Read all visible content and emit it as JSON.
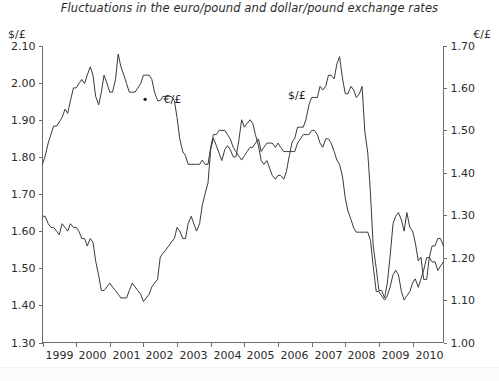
{
  "figure": {
    "title": "Fluctuations in the euro/pound and dollar/pound exchange rates",
    "left_axis_label": "$/£",
    "right_axis_label": "€/£"
  },
  "chart_data": {
    "type": "line",
    "title": "Fluctuations in the euro/pound and dollar/pound exchange rates",
    "xlabel": "",
    "ylabel": "$/£",
    "ylabel_right": "€/£",
    "grid": false,
    "legend": "inline-labels",
    "xlim": [
      1999.0,
      2010.92
    ],
    "ylim": [
      1.3,
      2.1
    ],
    "ylim_right": [
      1.0,
      1.7
    ],
    "yticks": [
      1.3,
      1.4,
      1.5,
      1.6,
      1.7,
      1.8,
      1.9,
      2.0,
      2.1
    ],
    "yticks_right": [
      1.0,
      1.1,
      1.2,
      1.3,
      1.4,
      1.5,
      1.6,
      1.7
    ],
    "xticks": [
      1999,
      2000,
      2001,
      2002,
      2003,
      2004,
      2005,
      2006,
      2007,
      2008,
      2009,
      2010
    ],
    "xtick_labels": [
      "1999",
      "2000",
      "2001",
      "2002",
      "2003",
      "2004",
      "2005",
      "2006",
      "2007",
      "2008",
      "2009",
      "2010"
    ],
    "annotations": [
      {
        "text": "€/£",
        "x": 2002.6,
        "y": 1.945,
        "axis": "left"
      },
      {
        "text": "$/£",
        "x": 2006.3,
        "y": 1.955,
        "axis": "left"
      }
    ],
    "series": [
      {
        "name": "€/£",
        "axis": "right",
        "unit": "euro per pound",
        "note": "plotted on right-hand scale 1.00-1.70",
        "x": [
          1999.0,
          1999.08,
          1999.17,
          1999.25,
          1999.33,
          1999.42,
          1999.5,
          1999.58,
          1999.67,
          1999.75,
          1999.83,
          1999.92,
          2000.0,
          2000.08,
          2000.17,
          2000.25,
          2000.33,
          2000.42,
          2000.5,
          2000.58,
          2000.67,
          2000.75,
          2000.83,
          2000.92,
          2001.0,
          2001.08,
          2001.17,
          2001.25,
          2001.33,
          2001.42,
          2001.5,
          2001.58,
          2001.67,
          2001.75,
          2001.83,
          2001.92,
          2002.0,
          2002.08,
          2002.17,
          2002.25,
          2002.33,
          2002.42,
          2002.5,
          2002.58,
          2002.67,
          2002.75,
          2002.83,
          2002.92,
          2003.0,
          2003.08,
          2003.17,
          2003.25,
          2003.33,
          2003.42,
          2003.5,
          2003.58,
          2003.67,
          2003.75,
          2003.83,
          2003.92,
          2004.0,
          2004.08,
          2004.17,
          2004.25,
          2004.33,
          2004.42,
          2004.5,
          2004.58,
          2004.67,
          2004.75,
          2004.83,
          2004.92,
          2005.0,
          2005.08,
          2005.17,
          2005.25,
          2005.33,
          2005.42,
          2005.5,
          2005.58,
          2005.67,
          2005.75,
          2005.83,
          2005.92,
          2006.0,
          2006.08,
          2006.17,
          2006.25,
          2006.33,
          2006.42,
          2006.5,
          2006.58,
          2006.67,
          2006.75,
          2006.83,
          2006.92,
          2007.0,
          2007.08,
          2007.17,
          2007.25,
          2007.33,
          2007.42,
          2007.5,
          2007.58,
          2007.67,
          2007.75,
          2007.83,
          2007.92,
          2008.0,
          2008.08,
          2008.17,
          2008.25,
          2008.33,
          2008.42,
          2008.5,
          2008.58,
          2008.67,
          2008.75,
          2008.83,
          2008.92,
          2009.0,
          2009.08,
          2009.17,
          2009.25,
          2009.33,
          2009.42,
          2009.5,
          2009.58,
          2009.67,
          2009.75,
          2009.83,
          2009.92,
          2010.0,
          2010.08,
          2010.17,
          2010.25,
          2010.33,
          2010.42,
          2010.5,
          2010.58,
          2010.67,
          2010.75,
          2010.83,
          2010.92
        ],
        "values": [
          1.42,
          1.44,
          1.47,
          1.49,
          1.51,
          1.51,
          1.52,
          1.53,
          1.55,
          1.54,
          1.57,
          1.6,
          1.6,
          1.61,
          1.62,
          1.61,
          1.63,
          1.65,
          1.63,
          1.58,
          1.56,
          1.59,
          1.63,
          1.61,
          1.59,
          1.59,
          1.62,
          1.68,
          1.65,
          1.63,
          1.61,
          1.59,
          1.59,
          1.59,
          1.6,
          1.61,
          1.63,
          1.63,
          1.63,
          1.62,
          1.59,
          1.57,
          1.57,
          1.58,
          1.58,
          1.58,
          1.58,
          1.57,
          1.53,
          1.48,
          1.45,
          1.44,
          1.42,
          1.42,
          1.42,
          1.42,
          1.42,
          1.43,
          1.42,
          1.42,
          1.46,
          1.49,
          1.49,
          1.5,
          1.5,
          1.5,
          1.49,
          1.48,
          1.46,
          1.45,
          1.44,
          1.43,
          1.44,
          1.45,
          1.46,
          1.46,
          1.47,
          1.48,
          1.45,
          1.46,
          1.47,
          1.47,
          1.47,
          1.46,
          1.47,
          1.46,
          1.45,
          1.45,
          1.45,
          1.45,
          1.45,
          1.47,
          1.48,
          1.49,
          1.49,
          1.49,
          1.5,
          1.5,
          1.49,
          1.47,
          1.46,
          1.48,
          1.48,
          1.47,
          1.45,
          1.43,
          1.42,
          1.39,
          1.34,
          1.31,
          1.29,
          1.27,
          1.26,
          1.26,
          1.26,
          1.26,
          1.26,
          1.24,
          1.18,
          1.12,
          1.12,
          1.11,
          1.1,
          1.11,
          1.13,
          1.16,
          1.17,
          1.16,
          1.12,
          1.1,
          1.11,
          1.12,
          1.14,
          1.15,
          1.13,
          1.15,
          1.17,
          1.2,
          1.2,
          1.19,
          1.19,
          1.17,
          1.18,
          1.19
        ]
      },
      {
        "name": "$/£",
        "axis": "left",
        "unit": "dollars per pound",
        "note": "plotted on left-hand scale 1.30-2.10",
        "x": [
          1999.0,
          1999.08,
          1999.17,
          1999.25,
          1999.33,
          1999.42,
          1999.5,
          1999.58,
          1999.67,
          1999.75,
          1999.83,
          1999.92,
          2000.0,
          2000.08,
          2000.17,
          2000.25,
          2000.33,
          2000.42,
          2000.5,
          2000.58,
          2000.67,
          2000.75,
          2000.83,
          2000.92,
          2001.0,
          2001.08,
          2001.17,
          2001.25,
          2001.33,
          2001.42,
          2001.5,
          2001.58,
          2001.67,
          2001.75,
          2001.83,
          2001.92,
          2002.0,
          2002.08,
          2002.17,
          2002.25,
          2002.33,
          2002.42,
          2002.5,
          2002.58,
          2002.67,
          2002.75,
          2002.83,
          2002.92,
          2003.0,
          2003.08,
          2003.17,
          2003.25,
          2003.33,
          2003.42,
          2003.5,
          2003.58,
          2003.67,
          2003.75,
          2003.83,
          2003.92,
          2004.0,
          2004.08,
          2004.17,
          2004.25,
          2004.33,
          2004.42,
          2004.5,
          2004.58,
          2004.67,
          2004.75,
          2004.83,
          2004.92,
          2005.0,
          2005.08,
          2005.17,
          2005.25,
          2005.33,
          2005.42,
          2005.5,
          2005.58,
          2005.67,
          2005.75,
          2005.83,
          2005.92,
          2006.0,
          2006.08,
          2006.17,
          2006.25,
          2006.33,
          2006.42,
          2006.5,
          2006.58,
          2006.67,
          2006.75,
          2006.83,
          2006.92,
          2007.0,
          2007.08,
          2007.17,
          2007.25,
          2007.33,
          2007.42,
          2007.5,
          2007.58,
          2007.67,
          2007.75,
          2007.83,
          2007.92,
          2008.0,
          2008.08,
          2008.17,
          2008.25,
          2008.33,
          2008.42,
          2008.5,
          2008.58,
          2008.67,
          2008.75,
          2008.83,
          2008.92,
          2009.0,
          2009.08,
          2009.17,
          2009.25,
          2009.33,
          2009.42,
          2009.5,
          2009.58,
          2009.67,
          2009.75,
          2009.83,
          2009.92,
          2010.0,
          2010.08,
          2010.17,
          2010.25,
          2010.33,
          2010.42,
          2010.5,
          2010.58,
          2010.67,
          2010.75,
          2010.83,
          2010.92
        ],
        "values": [
          1.64,
          1.64,
          1.62,
          1.61,
          1.61,
          1.6,
          1.59,
          1.62,
          1.61,
          1.6,
          1.62,
          1.61,
          1.61,
          1.6,
          1.58,
          1.58,
          1.56,
          1.58,
          1.57,
          1.52,
          1.48,
          1.44,
          1.44,
          1.45,
          1.46,
          1.45,
          1.44,
          1.43,
          1.42,
          1.42,
          1.42,
          1.44,
          1.46,
          1.45,
          1.44,
          1.43,
          1.41,
          1.42,
          1.43,
          1.45,
          1.46,
          1.47,
          1.53,
          1.54,
          1.55,
          1.56,
          1.57,
          1.58,
          1.61,
          1.6,
          1.58,
          1.58,
          1.62,
          1.64,
          1.62,
          1.6,
          1.62,
          1.67,
          1.7,
          1.73,
          1.82,
          1.85,
          1.83,
          1.81,
          1.79,
          1.82,
          1.83,
          1.82,
          1.8,
          1.8,
          1.84,
          1.9,
          1.88,
          1.89,
          1.9,
          1.89,
          1.86,
          1.83,
          1.79,
          1.78,
          1.79,
          1.77,
          1.75,
          1.74,
          1.75,
          1.75,
          1.74,
          1.76,
          1.8,
          1.84,
          1.85,
          1.88,
          1.88,
          1.88,
          1.9,
          1.94,
          1.96,
          1.96,
          1.96,
          1.99,
          1.98,
          1.99,
          2.02,
          2.02,
          2.01,
          2.05,
          2.07,
          2.01,
          1.97,
          1.97,
          1.99,
          1.98,
          1.96,
          1.97,
          1.99,
          1.87,
          1.81,
          1.7,
          1.56,
          1.5,
          1.44,
          1.44,
          1.42,
          1.46,
          1.53,
          1.62,
          1.64,
          1.65,
          1.63,
          1.6,
          1.65,
          1.61,
          1.6,
          1.57,
          1.52,
          1.53,
          1.47,
          1.47,
          1.53,
          1.56,
          1.56,
          1.58,
          1.58,
          1.56
        ]
      }
    ]
  }
}
